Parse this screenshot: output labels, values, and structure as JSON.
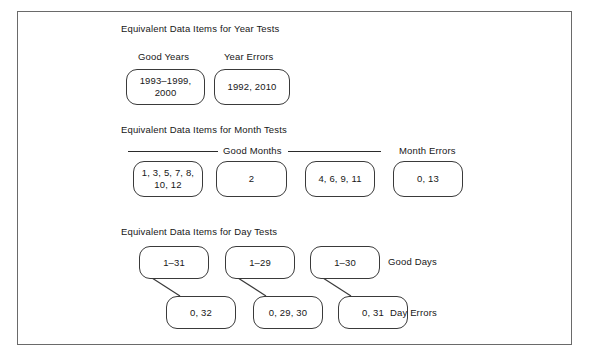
{
  "diagram": {
    "frame": {
      "present": true,
      "border_color": "#6a6a6a"
    },
    "sections": [
      {
        "id": "year",
        "heading": "Equivalent Data Items for Year Tests",
        "labels": [
          {
            "id": "good-years",
            "text": "Good Years"
          },
          {
            "id": "year-errors",
            "text": "Year Errors"
          }
        ],
        "nodes": [
          {
            "id": "good-years-box",
            "text": "1993–1999,\n2000"
          },
          {
            "id": "year-errors-box",
            "text": "1992, 2010"
          }
        ]
      },
      {
        "id": "month",
        "heading": "Equivalent Data Items for Month Tests",
        "labels": [
          {
            "id": "good-months",
            "text": "Good Months"
          },
          {
            "id": "month-errors",
            "text": "Month Errors"
          }
        ],
        "nodes": [
          {
            "id": "good-months-box-1",
            "text": "1, 3, 5, 7, 8,\n10, 12"
          },
          {
            "id": "good-months-box-2",
            "text": "2"
          },
          {
            "id": "good-months-box-3",
            "text": "4, 6, 9, 11"
          },
          {
            "id": "month-errors-box",
            "text": "0, 13"
          }
        ]
      },
      {
        "id": "day",
        "heading": "Equivalent Data Items for Day Tests",
        "labels": [
          {
            "id": "good-days",
            "text": "Good Days"
          },
          {
            "id": "day-errors",
            "text": "Day Errors"
          }
        ],
        "nodes": [
          {
            "id": "good-days-box-1",
            "text": "1–31"
          },
          {
            "id": "good-days-box-2",
            "text": "1–29"
          },
          {
            "id": "good-days-box-3",
            "text": "1–30"
          },
          {
            "id": "day-errors-box-1",
            "text": "0, 32"
          },
          {
            "id": "day-errors-box-2",
            "text": "0, 29, 30"
          },
          {
            "id": "day-errors-box-3",
            "text": "0, 31"
          }
        ],
        "connectors": 3
      }
    ],
    "colors": {
      "node_stroke": "#3a3a3a",
      "frame_stroke": "#6a6a6a",
      "text": "#171717",
      "background": "#ffffff"
    }
  }
}
